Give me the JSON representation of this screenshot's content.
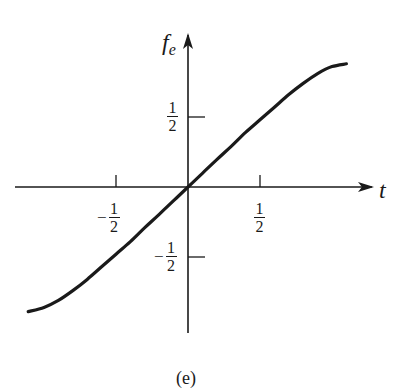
{
  "chart_data": {
    "type": "line",
    "title": "",
    "caption": "(e)",
    "xlabel": "t",
    "ylabel_base": "f",
    "ylabel_sub": "e",
    "xlim": [
      -1.11,
      1.11
    ],
    "ylim": [
      -0.9,
      0.9
    ],
    "grid": false,
    "legend": null,
    "x_ticks": [
      {
        "value": -0.5,
        "sign": "−",
        "num": "1",
        "den": "2"
      },
      {
        "value": 0.5,
        "sign": "",
        "num": "1",
        "den": "2"
      }
    ],
    "y_ticks": [
      {
        "value": 0.5,
        "sign": "",
        "num": "1",
        "den": "2"
      },
      {
        "value": -0.5,
        "sign": "−",
        "num": "1",
        "den": "2"
      }
    ],
    "series": [
      {
        "name": "f_e(t)",
        "description": "odd, monotonically increasing curve, approximately linear (slope ≈ 1) near origin, saturating toward ±0.88 at the ends",
        "x": [
          -1.11,
          -1.0,
          -0.9,
          -0.8,
          -0.7,
          -0.6,
          -0.5,
          -0.4,
          -0.3,
          -0.2,
          -0.1,
          0.0,
          0.1,
          0.2,
          0.3,
          0.4,
          0.5,
          0.6,
          0.7,
          0.8,
          0.9,
          1.0,
          1.1
        ],
        "y": [
          -0.89,
          -0.86,
          -0.81,
          -0.74,
          -0.66,
          -0.57,
          -0.48,
          -0.39,
          -0.29,
          -0.195,
          -0.098,
          0.0,
          0.098,
          0.195,
          0.29,
          0.39,
          0.48,
          0.57,
          0.66,
          0.74,
          0.81,
          0.86,
          0.88
        ]
      }
    ]
  },
  "labels": {
    "x_axis": "t",
    "y_axis_base": "f",
    "y_axis_sub": "e",
    "caption": "(e)"
  },
  "colors": {
    "ink": "#1a1a1a",
    "background": "#ffffff"
  }
}
